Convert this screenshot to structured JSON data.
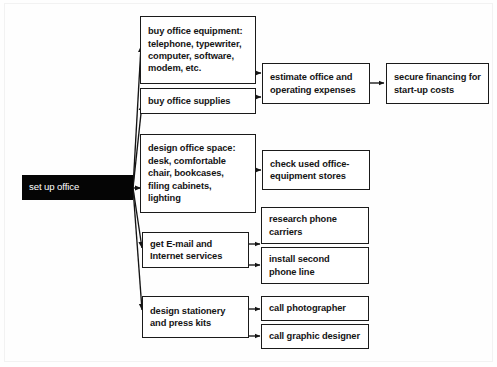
{
  "diagram": {
    "background_color": "#fefefe",
    "line_color": "#1a1a1a",
    "root_fill_color": "#050505",
    "root_text_color": "#ffffff",
    "root": {
      "label": "set up office"
    },
    "tasks": [
      {
        "id": "buy-office-equipment",
        "label": "buy office equipment:\ntelephone, typewriter,\ncomputer, software,\nmodem, etc."
      },
      {
        "id": "buy-office-supplies",
        "label": "buy office supplies"
      },
      {
        "id": "design-office-space",
        "label": "design office space:\ndesk, comfortable\nchair, bookcases,\nfiling cabinets,\nlighting"
      },
      {
        "id": "get-email-internet-services",
        "label": "get E-mail and\nInternet services"
      },
      {
        "id": "design-stationery-press-kits",
        "label": "design stationery\nand press kits"
      }
    ],
    "outcomes": [
      {
        "id": "estimate-office-operating-expenses",
        "label": "estimate office and\noperating expenses"
      },
      {
        "id": "secure-financing-startup-costs",
        "label": "secure financing for\nstart-up costs"
      },
      {
        "id": "check-used-office-equipment-stores",
        "label": "check used office-\nequipment stores"
      },
      {
        "id": "research-phone-carriers",
        "label": "research phone\ncarriers"
      },
      {
        "id": "install-second-phone-line",
        "label": "install second\nphone line"
      },
      {
        "id": "call-photographer",
        "label": "call photographer"
      },
      {
        "id": "call-graphic-designer",
        "label": "call graphic designer"
      }
    ]
  }
}
